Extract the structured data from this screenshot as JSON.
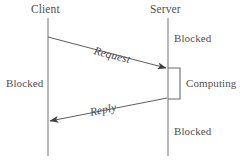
{
  "diagram": {
    "type": "sequence-diagram",
    "title": "",
    "background_color": "#ffffff",
    "line_color": "#9a9a9a",
    "arrow_color": "#4a4a4a",
    "text_color": "#4a4a4a",
    "actors": [
      {
        "id": "client",
        "label": "Client",
        "x": 48,
        "label_x": 31,
        "label_y": 4
      },
      {
        "id": "server",
        "label": "Server",
        "x": 168,
        "label_x": 150,
        "label_y": 4
      }
    ],
    "lifeline": {
      "top": 18,
      "bottom": 156
    },
    "messages": [
      {
        "id": "request",
        "label": "Request",
        "from": "client",
        "to": "server",
        "x1": 48,
        "y1": 37,
        "x2": 166,
        "y2": 68,
        "label_x": 94,
        "label_y": 45,
        "angle_deg": 14.7,
        "direction": "right"
      },
      {
        "id": "reply",
        "label": "Reply",
        "from": "server",
        "to": "client",
        "x1": 167,
        "y1": 98,
        "x2": 50,
        "y2": 121,
        "label_x": 90,
        "label_y": 107,
        "angle_deg": -11.1,
        "direction": "left"
      }
    ],
    "states": [
      {
        "id": "server-blocked-top",
        "label": "Blocked",
        "x": 174,
        "y": 33
      },
      {
        "id": "client-blocked",
        "label": "Blocked",
        "x": 6,
        "y": 78
      },
      {
        "id": "server-computing",
        "label": "Computing",
        "x": 186,
        "y": 78
      },
      {
        "id": "server-blocked-bottom",
        "label": "Blocked",
        "x": 174,
        "y": 126
      }
    ],
    "activation_bracket": {
      "id": "computing-bracket",
      "actor": "server",
      "x_left": 168,
      "x_right": 180,
      "y_top": 68,
      "y_bottom": 99
    }
  }
}
